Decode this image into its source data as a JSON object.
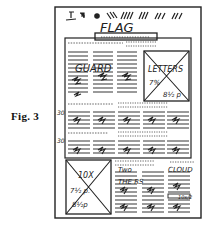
{
  "figure": {
    "label": "Fig. 3"
  },
  "page": {
    "masthead": {
      "flag_text": "FLAG",
      "nameplate_text": "minnow d"
    },
    "top_section": {
      "headline_scribble": "GUARD",
      "photo_box": {
        "lines": [
          "LETTERS",
          "7%",
          "8½ p"
        ]
      }
    },
    "middle_section": {
      "row1_margin_note": "30",
      "row2_margin_note": "30"
    },
    "bottom_section": {
      "photo_box": {
        "lines": [
          "10X",
          "7½ p.",
          "8½p"
        ]
      },
      "headline_scribbles": [
        "Two",
        "THE RS",
        "CLOUD"
      ],
      "margin_note": "10x/2"
    }
  },
  "colors": {
    "ink": "#222222",
    "paper": "#ffffff",
    "rule_gray": "#7a7a7a"
  }
}
